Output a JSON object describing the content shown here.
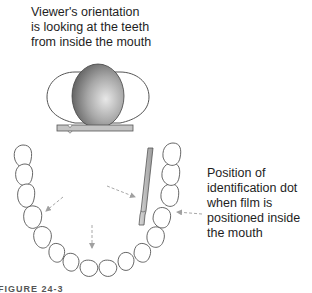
{
  "top_caption": {
    "lines": [
      "Viewer's orientation",
      "is looking at the teeth",
      "from inside the mouth"
    ]
  },
  "side_caption": {
    "lines": [
      "Position of",
      "identification dot",
      "when film is",
      "positioned inside",
      "the mouth"
    ]
  },
  "figure_label": "FIGURE 24-3",
  "illustration": {
    "head": "head-top-view",
    "film_horizontal": "film-with-identification-dot",
    "film_vertical": "film-inside-mouth",
    "arch": "mandibular-dental-arch",
    "arrows": [
      "arrow-to-left-molars",
      "arrow-to-incisors",
      "arrow-to-film",
      "arrow-to-dot"
    ],
    "colors": {
      "outline": "#555555",
      "film_fill": "#b8b8b8",
      "arrow": "#a8a8a8",
      "head_light": "#e0e0e0",
      "head_dark": "#6a6a6a"
    }
  }
}
